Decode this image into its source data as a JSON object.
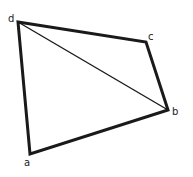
{
  "diagram": {
    "type": "quadrilateral",
    "vertices": [
      {
        "id": "a",
        "label": "a",
        "x": 30,
        "y": 154,
        "lx": 24,
        "ly": 166
      },
      {
        "id": "b",
        "label": "b",
        "x": 168,
        "y": 110,
        "lx": 172,
        "ly": 115
      },
      {
        "id": "c",
        "label": "c",
        "x": 146,
        "y": 42,
        "lx": 148,
        "ly": 40
      },
      {
        "id": "d",
        "label": "d",
        "x": 18,
        "y": 22,
        "lx": 8,
        "ly": 22
      }
    ],
    "edges": [
      {
        "from": "d",
        "to": "c",
        "weight": "thick"
      },
      {
        "from": "c",
        "to": "b",
        "weight": "thick"
      },
      {
        "from": "b",
        "to": "a",
        "weight": "thick"
      },
      {
        "from": "a",
        "to": "d",
        "weight": "thick"
      },
      {
        "from": "d",
        "to": "b",
        "weight": "thin"
      }
    ],
    "line_color": "#1a1a1a"
  }
}
